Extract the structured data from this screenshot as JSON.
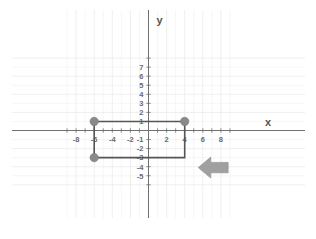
{
  "chart_data": {
    "type": "scatter",
    "title": "",
    "xlabel": "x",
    "ylabel": "y",
    "xlim": [
      -9,
      9
    ],
    "ylim": [
      -5.8,
      7.6
    ],
    "grid": true,
    "legend": "none",
    "x_ticks": [
      -8,
      -6,
      -4,
      -2,
      2,
      4,
      6,
      8
    ],
    "x_tick_labels": [
      "-8",
      "-6",
      "-4",
      "-2",
      "2",
      "4",
      "6",
      "8"
    ],
    "y_ticks": [
      7,
      6,
      5,
      4,
      3,
      2,
      1,
      -1,
      -2,
      -3,
      -4,
      -5
    ],
    "y_tick_labels": [
      "7",
      "6",
      "5",
      "4",
      "3",
      "2",
      "1",
      "-1",
      "-2",
      "-3",
      "-4",
      "-5"
    ],
    "shapes": [
      {
        "name": "rectangle",
        "kind": "polygon",
        "closed": true,
        "points": [
          [
            -6,
            1
          ],
          [
            4,
            1
          ],
          [
            4,
            -3
          ],
          [
            -6,
            -3
          ]
        ],
        "stroke": "#555555",
        "fill": "none",
        "stroke_width": 1.6
      }
    ],
    "points": [
      {
        "label": "vertex-top-left",
        "x": -6,
        "y": 1
      },
      {
        "label": "vertex-top-right",
        "x": 4,
        "y": 1
      },
      {
        "label": "vertex-bottom-left",
        "x": -6,
        "y": -3
      }
    ],
    "point_style": {
      "marker": "circle",
      "radius": 4.2,
      "color": "#8a8a8a"
    },
    "annotations": [
      {
        "name": "translation-arrow",
        "kind": "arrow",
        "direction": "left",
        "x_start": 8.8,
        "x_end": 5.5,
        "y": -4.1,
        "color": "#a0a0a0"
      }
    ]
  },
  "axes": {
    "x_label": "x",
    "y_label": "y",
    "axis_color": "#707070",
    "grid_color": "#ececec"
  },
  "icons": {
    "arrow": "left-arrow-icon"
  }
}
